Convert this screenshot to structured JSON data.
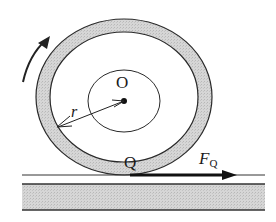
{
  "diagram": {
    "labels": {
      "center": "O",
      "radius": "r",
      "contact_point": "Q",
      "force_main": "F",
      "force_sub": "Q"
    },
    "colors": {
      "ring_fill": "#cfcfcf",
      "ground_fill": "#d4d4d4",
      "stroke": "#222222",
      "background": "#ffffff"
    },
    "elements": [
      "outer-ring",
      "inner-circle",
      "center-point-O",
      "radius-arrow-r",
      "rotation-arrow-counterclockwise",
      "ground-line",
      "ground-slab",
      "force-arrow-FQ"
    ]
  }
}
